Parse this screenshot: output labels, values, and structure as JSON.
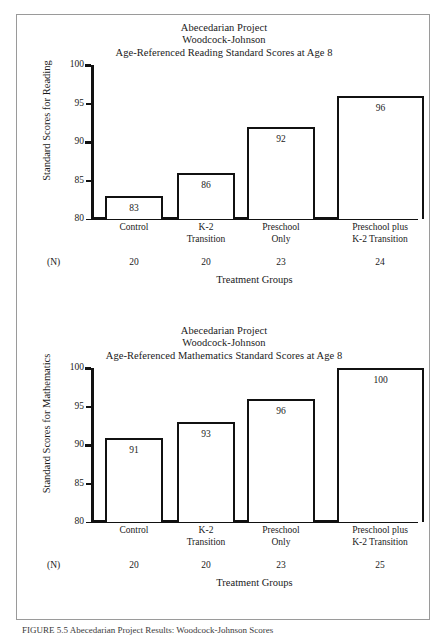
{
  "figure": {
    "caption": "FIGURE 5.5   Abecedarian Project Results: Woodcock-Johnson Scores"
  },
  "charts": [
    {
      "panel_name": "reading-chart",
      "title_lines": [
        "Abecedarian Project",
        "Woodcock-Johnson",
        "Age-Referenced Reading Standard Scores at Age 8"
      ],
      "ylabel": "Standard Scores for Reading",
      "xlabel": "Treatment Groups",
      "n_label": "(N)",
      "yticks": [
        80,
        85,
        90,
        95,
        100
      ],
      "categories": [
        [
          "Control"
        ],
        [
          "K-2",
          "Transition"
        ],
        [
          "Preschool",
          "Only"
        ],
        [
          "Preschool plus",
          "K-2 Transition"
        ]
      ],
      "values": [
        83,
        86,
        92,
        96
      ],
      "n_values": [
        20,
        20,
        23,
        24
      ]
    },
    {
      "panel_name": "mathematics-chart",
      "title_lines": [
        "Abecedarian Project",
        "Woodcock-Johnson",
        "Age-Referenced Mathematics Standard Scores at Age 8"
      ],
      "ylabel": "Standard Scores for Mathematics",
      "xlabel": "Treatment Groups",
      "n_label": "(N)",
      "yticks": [
        80,
        85,
        90,
        95,
        100
      ],
      "categories": [
        [
          "Control"
        ],
        [
          "K-2",
          "Transition"
        ],
        [
          "Preschool",
          "Only"
        ],
        [
          "Preschool plus",
          "K-2 Transition"
        ]
      ],
      "values": [
        91,
        93,
        96,
        100
      ],
      "n_values": [
        20,
        20,
        23,
        25
      ]
    }
  ],
  "chart_data": [
    {
      "type": "bar",
      "title": "Abecedarian Project / Woodcock-Johnson / Age-Referenced Reading Standard Scores at Age 8",
      "categories": [
        "Control",
        "K-2 Transition",
        "Preschool Only",
        "Preschool plus K-2 Transition"
      ],
      "values": [
        83,
        86,
        92,
        96
      ],
      "n": [
        20,
        20,
        23,
        24
      ],
      "xlabel": "Treatment Groups",
      "ylabel": "Standard Scores for Reading",
      "ylim": [
        80,
        100
      ],
      "yticks": [
        80,
        85,
        90,
        95,
        100
      ],
      "grid": false,
      "legend": "none",
      "bar_style": "white fill, black outline",
      "data_labels": "inside top of each bar"
    },
    {
      "type": "bar",
      "title": "Abecedarian Project / Woodcock-Johnson / Age-Referenced Mathematics Standard Scores at Age 8",
      "categories": [
        "Control",
        "K-2 Transition",
        "Preschool Only",
        "Preschool plus K-2 Transition"
      ],
      "values": [
        91,
        93,
        96,
        100
      ],
      "n": [
        20,
        20,
        23,
        25
      ],
      "xlabel": "Treatment Groups",
      "ylabel": "Standard Scores for Mathematics",
      "ylim": [
        80,
        100
      ],
      "yticks": [
        80,
        85,
        90,
        95,
        100
      ],
      "grid": false,
      "legend": "none",
      "bar_style": "white fill, black outline",
      "data_labels": "inside top of each bar"
    }
  ]
}
